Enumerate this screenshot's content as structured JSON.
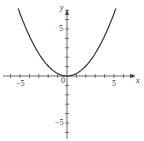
{
  "chart_data": {
    "type": "line",
    "title": "",
    "xlabel": "x",
    "ylabel": "y",
    "xlim": [
      -6.5,
      7
    ],
    "ylim": [
      -7,
      8
    ],
    "x_ticks": [
      -5,
      0,
      5
    ],
    "y_ticks": [
      -5,
      5
    ],
    "grid": false,
    "series": [
      {
        "name": "parabola",
        "x": [
          -5.2,
          -4,
          -3,
          -2,
          -1,
          0,
          1,
          2,
          3,
          4,
          5.2
        ],
        "y": [
          7.2,
          4.3,
          2.4,
          1.1,
          0.3,
          0,
          0.3,
          1.1,
          2.4,
          4.3,
          7.2
        ]
      }
    ]
  },
  "labels": {
    "x_axis": "x",
    "y_axis": "y",
    "x_neg5": "−5",
    "x_pos5": "5",
    "origin": "0",
    "y_pos5": "5",
    "y_neg5": "−5"
  }
}
